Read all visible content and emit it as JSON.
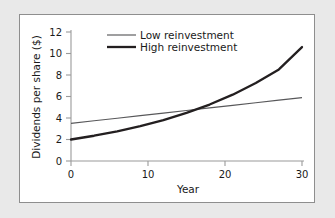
{
  "figure": {
    "background_color": "#e9e9e9",
    "panel_color": "#ffffff",
    "panel_border_color": "#8e8e8e"
  },
  "chart_data": {
    "type": "line",
    "title": "",
    "xlabel": "Year",
    "ylabel": "Dividends per share ($)",
    "xlim": [
      0,
      30
    ],
    "ylim": [
      0,
      12
    ],
    "xticks": [
      0,
      10,
      20,
      30
    ],
    "yticks": [
      0,
      2,
      4,
      6,
      8,
      10,
      12
    ],
    "xtick_labels": [
      "0",
      "10",
      "20",
      "30"
    ],
    "ytick_labels": [
      "0",
      "2",
      "4",
      "6",
      "8",
      "10",
      "12"
    ],
    "grid": false,
    "legend_position": "top-center",
    "x": [
      0,
      3,
      6,
      9,
      12,
      15,
      18,
      21,
      24,
      27,
      30
    ],
    "series": [
      {
        "name": "Low reinvestment",
        "color": "#58585a",
        "line_width": 1.15,
        "values": [
          3.5,
          3.74,
          3.98,
          4.22,
          4.46,
          4.7,
          4.94,
          5.18,
          5.42,
          5.66,
          5.9
        ]
      },
      {
        "name": "High reinvestment",
        "color": "#231f20",
        "line_width": 2.3,
        "values": [
          2.0,
          2.35,
          2.76,
          3.24,
          3.81,
          4.47,
          5.25,
          6.17,
          7.25,
          8.52,
          10.6
        ]
      }
    ],
    "annotations": {
      "crossover_year": 13.5,
      "crossover_value": 4.4
    }
  },
  "legend": {
    "entries": [
      {
        "label": "Low reinvestment",
        "swatch": "thin-line-swatch"
      },
      {
        "label": "High reinvestment",
        "swatch": "thick-line-swatch"
      }
    ]
  }
}
